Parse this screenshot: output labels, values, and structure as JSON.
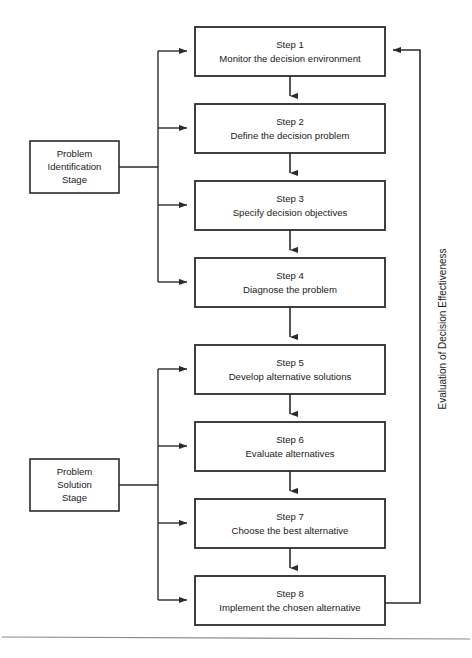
{
  "diagram": {
    "line_color": "#2b2b2b",
    "box_fill": "#ffffff",
    "rule_color": "#8a8a8a"
  },
  "steps": [
    {
      "number": "Step 1",
      "description": "Monitor the decision environment"
    },
    {
      "number": "Step 2",
      "description": "Define the decision problem"
    },
    {
      "number": "Step 3",
      "description": "Specify decision objectives"
    },
    {
      "number": "Step 4",
      "description": "Diagnose the problem"
    },
    {
      "number": "Step 5",
      "description": "Develop alternative solutions"
    },
    {
      "number": "Step 6",
      "description": "Evaluate alternatives"
    },
    {
      "number": "Step 7",
      "description": "Choose the best alternative"
    },
    {
      "number": "Step 8",
      "description": "Implement the chosen alternative"
    }
  ],
  "stages": [
    {
      "id": "problem-identification-stage",
      "lines": [
        "Problem",
        "Identification",
        "Stage"
      ]
    },
    {
      "id": "problem-solution-stage",
      "lines": [
        "Problem",
        "Solution",
        "Stage"
      ]
    }
  ],
  "feedback": {
    "label": "Evaluation of Decision Effectiveness"
  }
}
